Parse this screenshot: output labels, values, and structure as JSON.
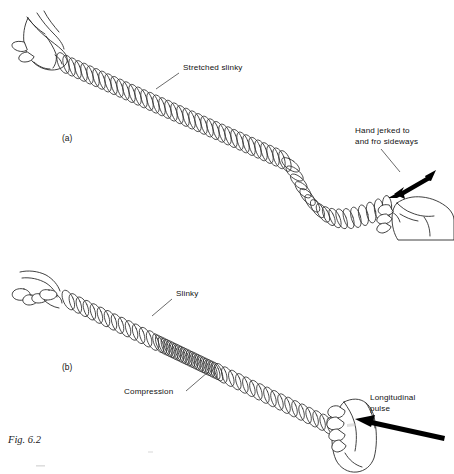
{
  "figure": {
    "caption": "Fig. 6.2",
    "background_color": "#ffffff",
    "ink_color": "#2b2b2b"
  },
  "panels": [
    {
      "id": "panel-a",
      "marker": "(a)",
      "marker_x": 62,
      "marker_y": 141,
      "wave_type": "transverse",
      "labels": [
        {
          "name": "stretched-slinky-label",
          "text": "Stretched slinky",
          "x": 183,
          "y": 70,
          "lines": [
            "Stretched slinky"
          ],
          "leader": "M 179 73 L 156 89"
        },
        {
          "name": "hand-jerked-label",
          "text": "Hand jerked to and fro sideways",
          "x": 355,
          "y": 133,
          "lines": [
            "Hand jerked to",
            "and fro sideways"
          ],
          "leader": "M 381 149 L 400 172"
        }
      ],
      "arrow": {
        "name": "double-headed-arrow",
        "kind": "double",
        "direction": "diagonal-ne-sw",
        "x1": 392,
        "y1": 193,
        "x2": 434,
        "y2": 172
      },
      "slinky": {
        "start": [
          63,
          63
        ],
        "end": [
          387,
          206
        ],
        "coil_count": 54,
        "coil_radius_x": 5.0,
        "coil_radius_y": 11.0
      },
      "hands": [
        {
          "name": "left-hand-gripping-slinky",
          "side": "left"
        },
        {
          "name": "right-hand-jerking-slinky",
          "side": "right"
        }
      ]
    },
    {
      "id": "panel-b",
      "marker": "(b)",
      "marker_x": 62,
      "marker_y": 370,
      "wave_type": "longitudinal",
      "labels": [
        {
          "name": "slinky-label",
          "text": "Slinky",
          "x": 176,
          "y": 296,
          "lines": [
            "Slinky"
          ],
          "leader": "M 172 299 L 152 316"
        },
        {
          "name": "compression-label",
          "text": "Compression",
          "x": 124,
          "y": 394,
          "lines": [
            "Compression"
          ],
          "leader": "M 186 391 L 208 372"
        },
        {
          "name": "longitudinal-pulse-label",
          "text": "Longitudinal pulse",
          "x": 370,
          "y": 400,
          "lines": [
            "Longitudinal",
            "pulse"
          ],
          "leader": null
        }
      ],
      "arrow": {
        "name": "longitudinal-pulse-arrow",
        "kind": "single",
        "direction": "left",
        "x1": 444,
        "y1": 438,
        "x2": 356,
        "y2": 419
      },
      "slinky": {
        "start": [
          62,
          297
        ],
        "end": [
          343,
          432
        ],
        "coil_count": 58,
        "coil_radius_x": 5.0,
        "coil_radius_y": 10.5,
        "compression": {
          "start_fraction": 0.34,
          "end_fraction": 0.56,
          "density_multiplier": 2.6
        }
      },
      "hands": [
        {
          "name": "left-hand-holding-slinky",
          "side": "left"
        },
        {
          "name": "right-hand-pushing-slinky",
          "side": "right"
        }
      ]
    }
  ]
}
